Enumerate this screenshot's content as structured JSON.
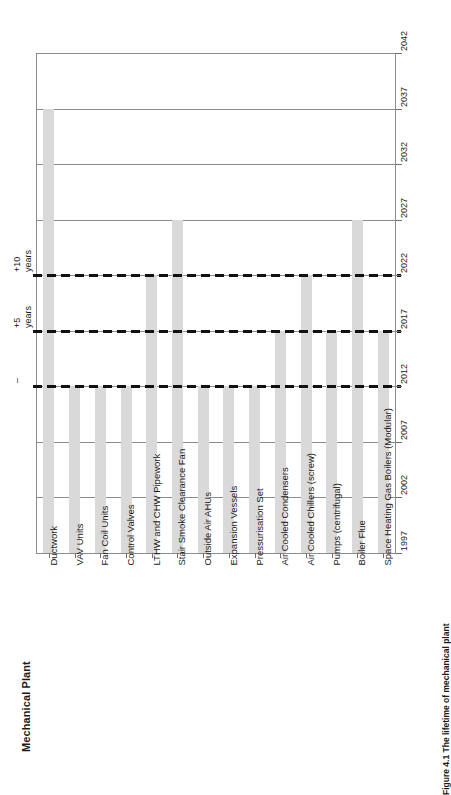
{
  "chart_title": "Mechanical Plant",
  "figure_caption": "Figure 4.1 The lifetime of mechanical plant",
  "axis": {
    "year_ticks": [
      "1997",
      "2002",
      "2007",
      "2012",
      "2017",
      "2022",
      "2027",
      "2032",
      "2037",
      "2042"
    ]
  },
  "reference_lines": [
    {
      "year": 2012,
      "label_line1": "–",
      "label_line2": ""
    },
    {
      "year": 2017,
      "label_line1": "+5",
      "label_line2": "years"
    },
    {
      "year": 2022,
      "label_line1": "+10",
      "label_line2": "years"
    }
  ],
  "categories": [
    "Ductwork",
    "VAV Units",
    "Fan Coil Units",
    "Control Valves",
    "LTHW and CHW Pipework",
    "Stair Smoke Clearance Fan",
    "Outside Air AHUs",
    "Expansion Vessels",
    "Pressurisation Set",
    "Air Cooled Condensers",
    "Air Cooled Chillers (screw)",
    "Pumps (centrifugal)",
    "Boiler Flue",
    "Space Heating Gas Boilers (Modular)"
  ],
  "chart_data": {
    "type": "bar",
    "title": "Mechanical Plant",
    "xlabel": "",
    "ylabel": "",
    "grid": true,
    "legend": "none",
    "orientation": "vertical-bars-on-rotated-page",
    "ylim": [
      1997,
      2042
    ],
    "yticks": [
      1997,
      2002,
      2007,
      2012,
      2017,
      2022,
      2027,
      2032,
      2037,
      2042
    ],
    "bar_base_year": 1997,
    "categories": [
      "Ductwork",
      "VAV Units",
      "Fan Coil Units",
      "Control Valves",
      "LTHW and CHW Pipework",
      "Stair Smoke Clearance Fan",
      "Outside Air AHUs",
      "Expansion Vessels",
      "Pressurisation Set",
      "Air Cooled Condensers",
      "Air Cooled Chillers (screw)",
      "Pumps (centrifugal)",
      "Boiler Flue",
      "Space Heating Gas Boilers (Modular)"
    ],
    "values": [
      2037,
      2012,
      2012,
      2012,
      2022,
      2027,
      2012,
      2012,
      2012,
      2017,
      2022,
      2017,
      2027,
      2017
    ],
    "lifetimes_years": [
      40,
      15,
      15,
      15,
      25,
      30,
      15,
      15,
      15,
      20,
      25,
      20,
      30,
      20
    ],
    "reference_lines": [
      2012,
      2017,
      2022
    ],
    "reference_labels": [
      "–",
      "+5 years",
      "+10 years"
    ],
    "bar_color": "#d9d9d9",
    "grid_color": "#8c8c8c",
    "reference_line_color": "#111111"
  }
}
